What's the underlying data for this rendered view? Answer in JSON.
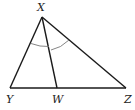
{
  "diagram": {
    "type": "triangle",
    "stroke_color": "#1a1a1a",
    "arc_color": "#777777",
    "vertices": {
      "X": {
        "label": "X",
        "x": 42,
        "y": 17
      },
      "Y": {
        "label": "Y",
        "x": 10,
        "y": 88
      },
      "W": {
        "label": "W",
        "x": 57,
        "y": 88
      },
      "Z": {
        "label": "Z",
        "x": 126,
        "y": 88
      }
    },
    "segments": [
      {
        "from": "X",
        "to": "Y"
      },
      {
        "from": "X",
        "to": "Z"
      },
      {
        "from": "Y",
        "to": "Z"
      },
      {
        "from": "X",
        "to": "W"
      }
    ],
    "angle_marks": [
      {
        "vertex": "X",
        "between": [
          "Y",
          "W"
        ],
        "name": "angle-YXW"
      },
      {
        "vertex": "X",
        "between": [
          "W",
          "Z"
        ],
        "name": "angle-WXZ"
      }
    ],
    "labels": {
      "X": "X",
      "Y": "Y",
      "W": "W",
      "Z": "Z"
    }
  }
}
